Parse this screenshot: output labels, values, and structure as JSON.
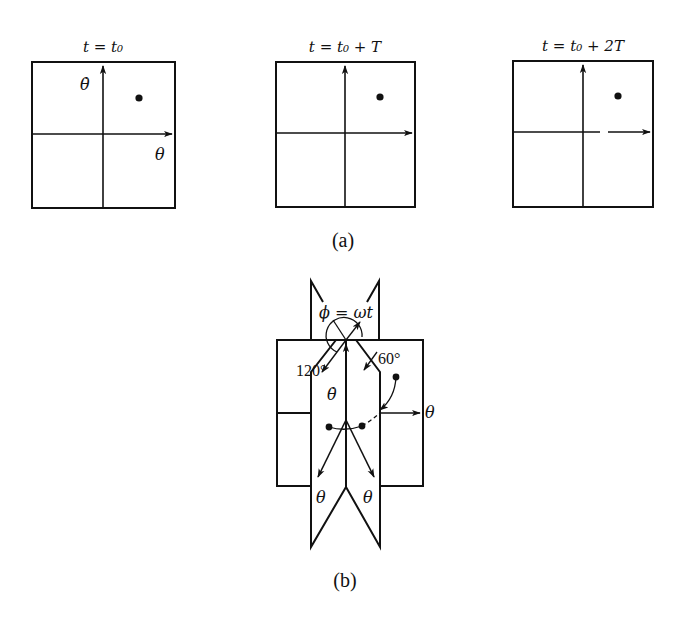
{
  "figure_a": {
    "caption": "(a)",
    "panels": [
      {
        "title": "t = t₀",
        "x_axis_label": "θ",
        "y_axis_label": "θ̇",
        "point": "phase point in first quadrant"
      },
      {
        "title": "t = t₀ + T",
        "point": "phase point in first quadrant"
      },
      {
        "title": "t = t₀ + 2T",
        "point": "phase point in first quadrant"
      }
    ]
  },
  "figure_b": {
    "caption": "(b)",
    "labels": {
      "phi": "ϕ = ωt",
      "angle_120": "120°",
      "angle_60": "60°",
      "theta_dot": "θ̇",
      "theta_right": "θ",
      "theta_bottom_left": "θ",
      "theta_bottom_right": "θ"
    }
  },
  "colors": {
    "ink": "#111111",
    "background": "#ffffff"
  }
}
